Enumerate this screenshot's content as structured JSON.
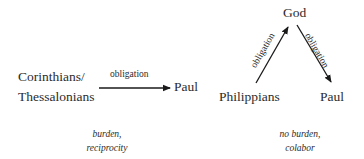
{
  "left_diagram": {
    "source_line1": "Corinthians/",
    "source_line2": "Thessalonians",
    "target": "Paul",
    "edge_label": "obligation",
    "caption_line1": "burden,",
    "caption_line2": "reciprocity"
  },
  "right_diagram": {
    "top_node": "God",
    "left_node": "Philippians",
    "right_node": "Paul",
    "edge_up_label": "obligation",
    "edge_down_label": "obligation",
    "caption_line1": "no burden,",
    "caption_line2": "colabor"
  },
  "colors": {
    "text": "#2b2b2b",
    "arrow": "#1a1a1a",
    "background": "#ffffff"
  }
}
